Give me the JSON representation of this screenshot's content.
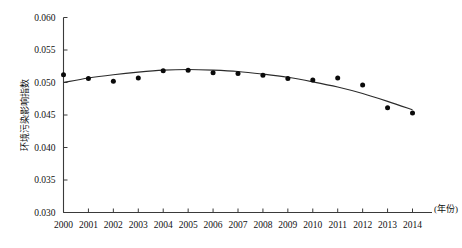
{
  "chart_data": {
    "type": "scatter",
    "title": "",
    "subtitle": "",
    "xlabel": "(年份)",
    "ylabel": "环境污染影响指数",
    "x": [
      2000,
      2001,
      2002,
      2003,
      2004,
      2005,
      2006,
      2007,
      2008,
      2009,
      2010,
      2011,
      2012,
      2013,
      2014
    ],
    "categories": [
      "2000",
      "2001",
      "2002",
      "2003",
      "2004",
      "2005",
      "2006",
      "2007",
      "2008",
      "2009",
      "2010",
      "2011",
      "2012",
      "2013",
      "2014"
    ],
    "values": [
      0.0512,
      0.0506,
      0.0502,
      0.0507,
      0.0518,
      0.0519,
      0.0515,
      0.0514,
      0.0511,
      0.0506,
      0.0504,
      0.0507,
      0.0496,
      0.0461,
      0.0453
    ],
    "series": [
      {
        "name": "观测值",
        "type": "scatter",
        "values": [
          0.0512,
          0.0506,
          0.0502,
          0.0507,
          0.0518,
          0.0519,
          0.0515,
          0.0514,
          0.0511,
          0.0506,
          0.0504,
          0.0507,
          0.0496,
          0.0461,
          0.0453
        ]
      },
      {
        "name": "拟合曲线",
        "type": "line",
        "values": [
          0.05,
          0.0507,
          0.0512,
          0.0516,
          0.0519,
          0.052,
          0.0519,
          0.0517,
          0.0513,
          0.0508,
          0.0501,
          0.0493,
          0.0483,
          0.0471,
          0.0458
        ]
      }
    ],
    "xlim": [
      2000,
      2014
    ],
    "ylim": [
      0.03,
      0.06
    ],
    "yticks": [
      0.03,
      0.035,
      0.04,
      0.045,
      0.05,
      0.055,
      0.06
    ],
    "ytick_labels": [
      "0.030",
      "0.035",
      "0.040",
      "0.045",
      "0.050",
      "0.055",
      "0.060"
    ],
    "xticks": [
      2000,
      2001,
      2002,
      2003,
      2004,
      2005,
      2006,
      2007,
      2008,
      2009,
      2010,
      2011,
      2012,
      2013,
      2014
    ],
    "xtick_labels": [
      "2000",
      "2001",
      "2002",
      "2003",
      "2004",
      "2005",
      "2006",
      "2007",
      "2008",
      "2009",
      "2010",
      "2011",
      "2012",
      "2013",
      "2014"
    ],
    "grid": false,
    "legend": false,
    "legend_position": "none",
    "marker_color": "#0a0a0a",
    "line_color": "#2b2b2b",
    "axis_color": "#3a3a3a",
    "background_color": "#ffffff"
  }
}
